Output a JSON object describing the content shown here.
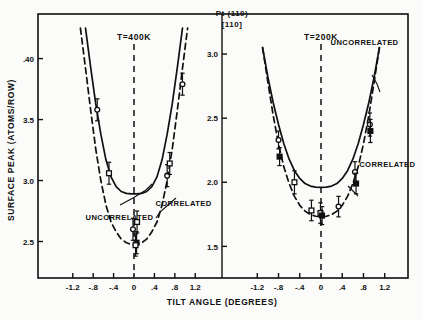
{
  "figure": {
    "title_line1": "Pt (110)",
    "title_line2": "[110]",
    "xlabel": "TILT ANGLE (DEGREES)",
    "ylabel": "SURFACE PEAK (ATOMS/ROW)"
  },
  "chart_data": {
    "type": "line",
    "xlabel": "TILT ANGLE (DEGREES)",
    "ylabel": "SURFACE PEAK (ATOMS/ROW)",
    "grid": false,
    "legend": "inline-annotations",
    "panels": [
      {
        "name": "left-panel",
        "annotation": "T=400K",
        "xlim": [
          -1.45,
          1.45
        ],
        "ylim": [
          2.25,
          4.3
        ],
        "xticks": [
          -1.2,
          -0.8,
          -0.4,
          0,
          0.4,
          0.8,
          1.2
        ],
        "xticklabels": [
          "-1.2",
          "-.8",
          "-.4",
          "0",
          ".4",
          ".8",
          "1.2"
        ],
        "yticks": [
          2.5,
          3.0,
          3.5,
          4.0
        ],
        "yticklabels": [
          "2.5",
          "3.0",
          "3.5",
          ".40"
        ],
        "center_line_x": 0,
        "series": [
          {
            "name": "UNCORRELATED",
            "style": "solid",
            "label_x": -0.95,
            "label_y": 2.68,
            "x": [
              -0.95,
              -0.85,
              -0.75,
              -0.65,
              -0.55,
              -0.45,
              -0.35,
              -0.25,
              -0.15,
              -0.05,
              0.05,
              0.15,
              0.25,
              0.35,
              0.45,
              0.55,
              0.65,
              0.75,
              0.85,
              0.95
            ],
            "y": [
              4.25,
              3.93,
              3.63,
              3.38,
              3.17,
              3.03,
              2.95,
              2.91,
              2.895,
              2.89,
              2.89,
              2.895,
              2.91,
              2.95,
              3.03,
              3.17,
              3.38,
              3.63,
              3.93,
              4.25
            ]
          },
          {
            "name": "CORRELATED",
            "style": "dashed",
            "label_x": 0.42,
            "label_y": 2.79,
            "x": [
              -1.05,
              -0.95,
              -0.85,
              -0.75,
              -0.65,
              -0.55,
              -0.45,
              -0.35,
              -0.25,
              -0.15,
              -0.05,
              0.05,
              0.15,
              0.25,
              0.35,
              0.45,
              0.55,
              0.65,
              0.75,
              0.85,
              0.95,
              1.05
            ],
            "y": [
              4.25,
              3.92,
              3.58,
              3.26,
              3.0,
              2.8,
              2.66,
              2.58,
              2.52,
              2.49,
              2.475,
              2.475,
              2.49,
              2.52,
              2.58,
              2.66,
              2.8,
              3.0,
              3.26,
              3.58,
              3.92,
              4.25
            ]
          }
        ],
        "points": [
          {
            "x": -0.72,
            "y": 3.58,
            "yerr": 0.09,
            "marker": "open-circle"
          },
          {
            "x": -0.49,
            "y": 3.06,
            "yerr": 0.09,
            "marker": "open-square"
          },
          {
            "x": -0.02,
            "y": 2.6,
            "yerr": 0.09,
            "marker": "open-circle"
          },
          {
            "x": 0.06,
            "y": 2.66,
            "yerr": 0.09,
            "marker": "open-square"
          },
          {
            "x": 0.05,
            "y": 2.49,
            "yerr": 0.09,
            "marker": "filled-square"
          },
          {
            "x": 0.03,
            "y": 2.47,
            "yerr": 0.09,
            "marker": "open-square"
          },
          {
            "x": 0.65,
            "y": 3.04,
            "yerr": 0.09,
            "marker": "open-circle"
          },
          {
            "x": 0.7,
            "y": 3.14,
            "yerr": 0.09,
            "marker": "open-square"
          },
          {
            "x": 0.95,
            "y": 3.79,
            "yerr": 0.09,
            "marker": "open-circle"
          }
        ]
      },
      {
        "name": "right-panel",
        "annotation": "T=200K",
        "xlim": [
          -1.45,
          1.45
        ],
        "ylim": [
          1.3,
          3.25
        ],
        "xticks": [
          -1.2,
          -0.8,
          -0.4,
          0,
          0.4,
          0.8,
          1.2
        ],
        "xticklabels": [
          "-1.2",
          "-.8",
          "-.4",
          "0",
          ".4",
          ".8",
          "1.2"
        ],
        "yticks": [
          1.5,
          2.0,
          2.5,
          3.0
        ],
        "yticklabels": [
          "1.5",
          "2.0",
          "2.5",
          "3.0"
        ],
        "center_line_x": 0,
        "series": [
          {
            "name": "UNCORRELATED",
            "style": "solid",
            "label_x": 0.18,
            "label_y": 3.07,
            "x": [
              -1.1,
              -1.0,
              -0.9,
              -0.8,
              -0.7,
              -0.6,
              -0.5,
              -0.4,
              -0.3,
              -0.2,
              -0.1,
              0.0,
              0.1,
              0.2,
              0.3,
              0.4,
              0.5,
              0.6,
              0.7,
              0.8,
              0.9,
              1.0,
              1.1
            ],
            "y": [
              3.05,
              2.82,
              2.62,
              2.45,
              2.3,
              2.18,
              2.09,
              2.03,
              1.99,
              1.97,
              1.962,
              1.96,
              1.962,
              1.97,
              1.99,
              2.03,
              2.09,
              2.18,
              2.3,
              2.45,
              2.62,
              2.82,
              3.05
            ]
          },
          {
            "name": "CORRELATED",
            "style": "dashed",
            "label_x": 0.72,
            "label_y": 2.12,
            "x": [
              -1.1,
              -1.0,
              -0.9,
              -0.8,
              -0.7,
              -0.6,
              -0.5,
              -0.4,
              -0.3,
              -0.2,
              -0.1,
              0.0,
              0.1,
              0.2,
              0.3,
              0.4,
              0.5,
              0.6,
              0.7,
              0.8,
              0.9,
              1.0,
              1.1
            ],
            "y": [
              3.05,
              2.78,
              2.52,
              2.3,
              2.12,
              1.99,
              1.89,
              1.82,
              1.775,
              1.748,
              1.735,
              1.73,
              1.735,
              1.748,
              1.775,
              1.82,
              1.89,
              1.99,
              2.12,
              2.3,
              2.52,
              2.78,
              3.05
            ]
          }
        ],
        "points": [
          {
            "x": -0.8,
            "y": 2.33,
            "yerr": 0.07,
            "marker": "open-circle"
          },
          {
            "x": -0.78,
            "y": 2.2,
            "yerr": 0.07,
            "marker": "filled-square"
          },
          {
            "x": -0.5,
            "y": 2.0,
            "yerr": 0.09,
            "marker": "open-square"
          },
          {
            "x": -0.18,
            "y": 1.78,
            "yerr": 0.08,
            "marker": "open-square"
          },
          {
            "x": -0.01,
            "y": 1.76,
            "yerr": 0.08,
            "marker": "open-square"
          },
          {
            "x": 0.02,
            "y": 1.74,
            "yerr": 0.07,
            "marker": "filled-square"
          },
          {
            "x": 0.33,
            "y": 1.81,
            "yerr": 0.08,
            "marker": "open-circle"
          },
          {
            "x": 0.64,
            "y": 2.08,
            "yerr": 0.08,
            "marker": "open-circle"
          },
          {
            "x": 0.66,
            "y": 1.99,
            "yerr": 0.08,
            "marker": "filled-square"
          },
          {
            "x": 0.92,
            "y": 2.45,
            "yerr": 0.09,
            "marker": "open-circle"
          },
          {
            "x": 0.93,
            "y": 2.4,
            "yerr": 0.09,
            "marker": "filled-square"
          }
        ]
      }
    ]
  },
  "colors": {
    "ink": "#101010",
    "paper": "#fbfbf9"
  }
}
